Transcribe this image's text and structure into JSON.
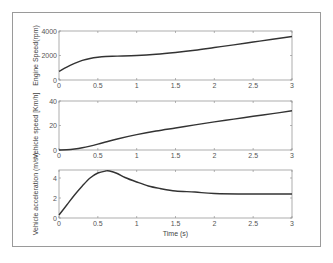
{
  "figure": {
    "xlabel": "Time (s)",
    "x_ticks": [
      "0",
      "0.5",
      "1",
      "1.5",
      "2",
      "2.5",
      "3"
    ]
  },
  "chart_data": [
    {
      "type": "line",
      "title": "",
      "xlabel": "",
      "ylabel": "Engine Speed(rpm)",
      "xlim": [
        0,
        3
      ],
      "ylim": [
        0,
        4000
      ],
      "x_ticks": [
        "0",
        "0.5",
        "1",
        "1.5",
        "2",
        "2.5",
        "3"
      ],
      "y_ticks": [
        "0",
        "2000",
        "4000"
      ],
      "grid": false,
      "series": [
        {
          "name": "Engine Speed",
          "x": [
            0,
            0.1,
            0.2,
            0.3,
            0.4,
            0.5,
            0.6,
            0.75,
            1.0,
            1.25,
            1.5,
            1.75,
            2.0,
            2.25,
            2.5,
            2.75,
            3.0
          ],
          "y": [
            700,
            1050,
            1350,
            1600,
            1760,
            1860,
            1920,
            1950,
            2000,
            2100,
            2250,
            2430,
            2650,
            2870,
            3100,
            3330,
            3550
          ]
        }
      ]
    },
    {
      "type": "line",
      "title": "",
      "xlabel": "",
      "ylabel": "Vehicle speed [Km/h]",
      "xlim": [
        0,
        3
      ],
      "ylim": [
        0,
        40
      ],
      "x_ticks": [
        "0",
        "0.5",
        "1",
        "1.5",
        "2",
        "2.5",
        "3"
      ],
      "y_ticks": [
        "0",
        "20",
        "40"
      ],
      "grid": false,
      "series": [
        {
          "name": "Vehicle speed",
          "x": [
            0,
            0.1,
            0.2,
            0.3,
            0.4,
            0.5,
            0.6,
            0.75,
            1.0,
            1.25,
            1.5,
            1.75,
            2.0,
            2.25,
            2.5,
            2.75,
            3.0
          ],
          "y": [
            0,
            0.2,
            0.8,
            1.8,
            3.2,
            4.8,
            6.5,
            9.0,
            12.5,
            15.5,
            18.0,
            20.5,
            23.0,
            25.2,
            27.5,
            29.7,
            32.0
          ]
        }
      ]
    },
    {
      "type": "line",
      "title": "",
      "xlabel": "Time (s)",
      "ylabel": "Vehicle acceleration (m/s²)",
      "xlim": [
        0,
        3
      ],
      "ylim": [
        0,
        4.8
      ],
      "x_ticks": [
        "0",
        "0.5",
        "1",
        "1.5",
        "2",
        "2.5",
        "3"
      ],
      "y_ticks": [
        "0",
        "2",
        "4"
      ],
      "grid": false,
      "series": [
        {
          "name": "Vehicle acceleration",
          "x": [
            0,
            0.1,
            0.2,
            0.3,
            0.4,
            0.5,
            0.6,
            0.65,
            0.75,
            0.85,
            1.0,
            1.15,
            1.3,
            1.5,
            1.75,
            2.0,
            2.5,
            3.0
          ],
          "y": [
            0.3,
            1.3,
            2.3,
            3.2,
            4.0,
            4.5,
            4.7,
            4.7,
            4.45,
            4.05,
            3.6,
            3.2,
            2.95,
            2.7,
            2.6,
            2.45,
            2.4,
            2.4
          ]
        }
      ]
    }
  ]
}
